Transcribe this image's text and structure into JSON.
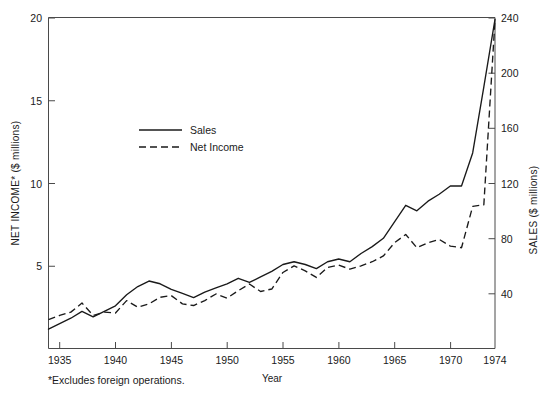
{
  "chart_data": {
    "type": "line",
    "title": "",
    "xlabel": "Year",
    "ylabel": "NET INCOME* ($ millions)",
    "y2label": "SALES ($ millions)",
    "footnote": "*Excludes foreign operations.",
    "grid": false,
    "legend_position": "inside-upper-left",
    "xlim": [
      1934,
      1974
    ],
    "xticks": [
      1935,
      1940,
      1945,
      1950,
      1955,
      1960,
      1965,
      1970,
      1974
    ],
    "xtick_labels": [
      "1935",
      "1940",
      "1945",
      "1950",
      "1955",
      "1960",
      "1965",
      "1970",
      "1974"
    ],
    "ylim": [
      0,
      20
    ],
    "yticks": [
      5,
      10,
      15,
      20
    ],
    "ytick_labels": [
      "5",
      "10",
      "15",
      "20"
    ],
    "y2lim": [
      0,
      240
    ],
    "y2ticks": [
      40,
      80,
      120,
      160,
      200,
      240
    ],
    "y2tick_labels": [
      "40",
      "80",
      "120",
      "160",
      "200",
      "240"
    ],
    "x": [
      1934,
      1935,
      1936,
      1937,
      1938,
      1939,
      1940,
      1941,
      1942,
      1943,
      1944,
      1945,
      1946,
      1947,
      1948,
      1949,
      1950,
      1951,
      1952,
      1953,
      1954,
      1955,
      1956,
      1957,
      1958,
      1959,
      1960,
      1961,
      1962,
      1963,
      1964,
      1965,
      1966,
      1967,
      1968,
      1969,
      1970,
      1971,
      1972,
      1973,
      1974
    ],
    "series": [
      {
        "name": "Sales",
        "axis": "right",
        "units": "$ millions",
        "style": "solid",
        "values": [
          14,
          18,
          22,
          27,
          23,
          27,
          31,
          39,
          45,
          49,
          47,
          43,
          40,
          37,
          41,
          44,
          47,
          51,
          48,
          52,
          56,
          61,
          63,
          61,
          58,
          63,
          65,
          63,
          69,
          74,
          80,
          92,
          104,
          100,
          107,
          112,
          118,
          118,
          142,
          190,
          239
        ]
      },
      {
        "name": "Net Income",
        "axis": "left",
        "units": "$ millions",
        "style": "dashed",
        "values": [
          1.75,
          2.0,
          2.2,
          2.75,
          2.0,
          2.2,
          2.15,
          2.9,
          2.5,
          2.7,
          3.1,
          3.2,
          2.7,
          2.6,
          2.9,
          3.3,
          3.05,
          3.5,
          3.9,
          3.45,
          3.6,
          4.6,
          5.0,
          4.7,
          4.3,
          4.9,
          5.05,
          4.8,
          5.0,
          5.25,
          5.6,
          6.4,
          6.9,
          6.1,
          6.4,
          6.6,
          6.2,
          6.1,
          8.6,
          8.7,
          19.9
        ]
      }
    ],
    "legend": [
      {
        "label": "Sales",
        "style": "solid"
      },
      {
        "label": "Net Income",
        "style": "dashed"
      }
    ]
  }
}
